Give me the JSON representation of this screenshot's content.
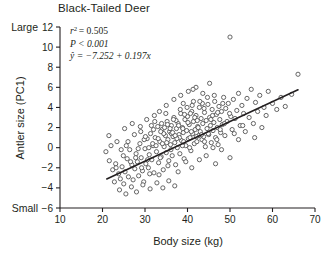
{
  "chart_data": {
    "type": "scatter",
    "title": "Black-Tailed Deer",
    "xlabel": "Body size (kg)",
    "ylabel": "Antler size (PC1)",
    "xlim": [
      10,
      70
    ],
    "ylim": [
      -6,
      12
    ],
    "xticks": [
      10,
      20,
      30,
      40,
      50,
      60,
      70
    ],
    "yticks": [
      -6,
      -4,
      -2,
      0,
      2,
      4,
      6,
      8,
      10,
      12
    ],
    "grid": false,
    "legend": null,
    "axis_end_labels": {
      "y_low": "Small",
      "y_high": "Large"
    },
    "annotations": {
      "r_squared_label": "r",
      "r_squared_sup": "2",
      "r_squared_value": "= 0.505",
      "p_value": "P < 0.001",
      "equation": "ŷ = −7.252 + 0.197x"
    },
    "fit": {
      "type": "linear",
      "intercept": -7.252,
      "slope": 0.197,
      "r_squared": 0.505,
      "p_value": "<0.001",
      "x_start": 21.0,
      "x_end": 66.0
    },
    "marker": {
      "shape": "open-circle",
      "size_px": 4.2,
      "stroke": "#555555",
      "fill": "#ffffff"
    },
    "points": [
      [
        20.8,
        -0.4
      ],
      [
        21.6,
        -1.3
      ],
      [
        22.4,
        -2.2
      ],
      [
        22.0,
        0.2
      ],
      [
        23.1,
        -1.6
      ],
      [
        23.8,
        -2.6
      ],
      [
        24.2,
        -3.1
      ],
      [
        24.6,
        -1.9
      ],
      [
        24.9,
        -0.8
      ],
      [
        25.3,
        -2.4
      ],
      [
        25.0,
        -3.6
      ],
      [
        25.8,
        -1.1
      ],
      [
        26.1,
        -2.9
      ],
      [
        26.4,
        -0.2
      ],
      [
        26.9,
        -1.7
      ],
      [
        27.2,
        -3.2
      ],
      [
        27.6,
        -2.1
      ],
      [
        27.9,
        -0.6
      ],
      [
        28.2,
        -1.4
      ],
      [
        28.5,
        -2.8
      ],
      [
        28.8,
        0.4
      ],
      [
        29.1,
        -1.0
      ],
      [
        29.4,
        -2.3
      ],
      [
        29.7,
        -3.4
      ],
      [
        30.0,
        -0.1
      ],
      [
        30.2,
        -1.6
      ],
      [
        30.5,
        0.9
      ],
      [
        30.8,
        -2.0
      ],
      [
        31.0,
        -0.7
      ],
      [
        31.3,
        1.4
      ],
      [
        31.6,
        -1.2
      ],
      [
        31.9,
        0.2
      ],
      [
        32.1,
        -2.5
      ],
      [
        32.4,
        1.0
      ],
      [
        32.7,
        -0.4
      ],
      [
        33.0,
        2.1
      ],
      [
        33.2,
        -1.5
      ],
      [
        33.5,
        0.6
      ],
      [
        33.8,
        -0.9
      ],
      [
        34.0,
        1.8
      ],
      [
        34.3,
        -2.2
      ],
      [
        34.5,
        0.1
      ],
      [
        34.8,
        1.2
      ],
      [
        35.0,
        -0.5
      ],
      [
        35.2,
        2.6
      ],
      [
        35.4,
        0.8
      ],
      [
        35.6,
        -1.3
      ],
      [
        35.8,
        1.6
      ],
      [
        36.0,
        0.3
      ],
      [
        36.2,
        2.2
      ],
      [
        36.4,
        -0.8
      ],
      [
        36.6,
        1.1
      ],
      [
        36.8,
        3.0
      ],
      [
        37.0,
        0.5
      ],
      [
        37.2,
        -1.7
      ],
      [
        37.4,
        1.9
      ],
      [
        37.6,
        0.0
      ],
      [
        37.8,
        2.4
      ],
      [
        38.0,
        1.3
      ],
      [
        38.2,
        -0.6
      ],
      [
        38.4,
        3.4
      ],
      [
        38.6,
        0.7
      ],
      [
        38.8,
        2.0
      ],
      [
        39.0,
        1.5
      ],
      [
        39.2,
        -1.1
      ],
      [
        39.4,
        2.8
      ],
      [
        39.6,
        0.2
      ],
      [
        39.8,
        1.7
      ],
      [
        40.0,
        3.1
      ],
      [
        40.2,
        0.9
      ],
      [
        40.4,
        2.3
      ],
      [
        40.6,
        1.0
      ],
      [
        40.8,
        -0.3
      ],
      [
        41.0,
        3.6
      ],
      [
        41.2,
        1.4
      ],
      [
        41.4,
        2.6
      ],
      [
        41.6,
        0.4
      ],
      [
        41.8,
        1.8
      ],
      [
        42.0,
        3.2
      ],
      [
        42.2,
        0.6
      ],
      [
        42.4,
        2.1
      ],
      [
        42.6,
        1.2
      ],
      [
        42.8,
        4.0
      ],
      [
        43.0,
        1.6
      ],
      [
        43.2,
        2.9
      ],
      [
        43.4,
        0.8
      ],
      [
        43.6,
        2.4
      ],
      [
        43.8,
        1.1
      ],
      [
        44.0,
        3.5
      ],
      [
        44.2,
        0.1
      ],
      [
        44.4,
        2.7
      ],
      [
        44.6,
        1.9
      ],
      [
        44.8,
        4.3
      ],
      [
        45.0,
        1.3
      ],
      [
        45.2,
        3.0
      ],
      [
        45.4,
        2.2
      ],
      [
        45.6,
        0.5
      ],
      [
        45.8,
        3.8
      ],
      [
        46.0,
        1.7
      ],
      [
        46.2,
        2.5
      ],
      [
        46.4,
        4.6
      ],
      [
        46.6,
        1.0
      ],
      [
        46.8,
        3.3
      ],
      [
        47.0,
        2.0
      ],
      [
        47.2,
        0.3
      ],
      [
        47.4,
        4.1
      ],
      [
        47.6,
        2.8
      ],
      [
        47.8,
        1.5
      ],
      [
        48.0,
        3.6
      ],
      [
        48.2,
        2.3
      ],
      [
        48.5,
        5.0
      ],
      [
        48.8,
        1.2
      ],
      [
        49.0,
        3.9
      ],
      [
        49.3,
        2.6
      ],
      [
        49.6,
        4.4
      ],
      [
        50.0,
        11.0
      ],
      [
        50.2,
        3.1
      ],
      [
        50.5,
        1.8
      ],
      [
        50.8,
        4.8
      ],
      [
        51.2,
        2.9
      ],
      [
        51.6,
        3.7
      ],
      [
        52.0,
        5.4
      ],
      [
        52.4,
        2.2
      ],
      [
        52.8,
        4.2
      ],
      [
        53.2,
        3.4
      ],
      [
        53.6,
        1.6
      ],
      [
        54.0,
        4.9
      ],
      [
        54.5,
        3.0
      ],
      [
        55.0,
        5.8
      ],
      [
        55.5,
        2.4
      ],
      [
        56.0,
        4.5
      ],
      [
        56.5,
        3.6
      ],
      [
        57.0,
        5.2
      ],
      [
        57.5,
        2.0
      ],
      [
        58.0,
        4.0
      ],
      [
        58.5,
        3.2
      ],
      [
        59.0,
        5.6
      ],
      [
        60.0,
        4.4
      ],
      [
        61.0,
        3.8
      ],
      [
        62.0,
        5.0
      ],
      [
        63.0,
        4.1
      ],
      [
        64.5,
        5.3
      ],
      [
        66.0,
        7.3
      ],
      [
        24.0,
        -4.2
      ],
      [
        25.5,
        -4.6
      ],
      [
        26.8,
        -3.9
      ],
      [
        28.0,
        -4.4
      ],
      [
        29.5,
        -3.7
      ],
      [
        31.2,
        -4.1
      ],
      [
        32.8,
        -3.5
      ],
      [
        34.2,
        -4.0
      ],
      [
        35.6,
        -3.3
      ],
      [
        37.0,
        -3.8
      ],
      [
        21.5,
        1.2
      ],
      [
        23.4,
        0.6
      ],
      [
        25.2,
        1.9
      ],
      [
        27.0,
        2.4
      ],
      [
        22.8,
        -3.4
      ],
      [
        33.4,
        3.6
      ],
      [
        35.0,
        4.2
      ],
      [
        36.8,
        4.8
      ],
      [
        38.4,
        5.2
      ],
      [
        40.2,
        5.6
      ],
      [
        42.0,
        6.0
      ],
      [
        43.6,
        5.4
      ],
      [
        45.2,
        6.4
      ],
      [
        39.0,
        4.4
      ],
      [
        41.4,
        4.6
      ],
      [
        30.4,
        2.8
      ],
      [
        32.2,
        3.2
      ],
      [
        34.6,
        2.0
      ],
      [
        36.2,
        1.4
      ],
      [
        38.8,
        0.2
      ],
      [
        29.0,
        1.6
      ],
      [
        31.8,
        0.4
      ],
      [
        33.6,
        -1.0
      ],
      [
        35.4,
        -1.8
      ],
      [
        37.8,
        -2.4
      ],
      [
        39.6,
        -1.4
      ],
      [
        41.0,
        -2.0
      ],
      [
        42.8,
        -1.2
      ],
      [
        44.4,
        -0.8
      ],
      [
        46.6,
        -1.6
      ],
      [
        48.0,
        -0.2
      ],
      [
        50.0,
        -1.0
      ],
      [
        52.0,
        0.8
      ],
      [
        44.0,
        0.6
      ],
      [
        46.0,
        0.0
      ],
      [
        35.1,
        0.5
      ],
      [
        36.5,
        1.5
      ],
      [
        37.3,
        2.7
      ],
      [
        38.1,
        1.0
      ],
      [
        39.3,
        3.3
      ],
      [
        40.1,
        2.5
      ],
      [
        40.9,
        1.6
      ],
      [
        41.7,
        3.0
      ],
      [
        42.5,
        2.0
      ],
      [
        43.3,
        1.3
      ],
      [
        34.4,
        1.4
      ],
      [
        33.1,
        0.9
      ],
      [
        32.0,
        1.8
      ],
      [
        30.9,
        0.0
      ],
      [
        29.8,
        0.8
      ],
      [
        43.9,
        3.9
      ],
      [
        45.5,
        2.8
      ],
      [
        47.1,
        3.5
      ],
      [
        48.7,
        2.4
      ],
      [
        49.9,
        3.4
      ],
      [
        36.1,
        -0.2
      ],
      [
        37.5,
        0.9
      ],
      [
        38.9,
        1.9
      ],
      [
        40.5,
        0.0
      ],
      [
        42.1,
        1.1
      ],
      [
        26.0,
        0.6
      ],
      [
        27.5,
        1.3
      ],
      [
        28.9,
        2.1
      ],
      [
        30.1,
        1.1
      ],
      [
        31.5,
        2.2
      ],
      [
        44.9,
        1.4
      ],
      [
        46.9,
        0.8
      ],
      [
        51.0,
        1.4
      ],
      [
        53.0,
        2.2
      ],
      [
        55.8,
        1.0
      ],
      [
        38.3,
        3.8
      ],
      [
        39.9,
        4.0
      ],
      [
        41.1,
        4.2
      ],
      [
        34.9,
        3.4
      ],
      [
        33.9,
        2.4
      ],
      [
        36.7,
        2.8
      ],
      [
        37.9,
        2.2
      ],
      [
        35.9,
        1.9
      ],
      [
        34.1,
        0.4
      ],
      [
        32.6,
        0.2
      ],
      [
        40.7,
        3.4
      ],
      [
        42.3,
        2.7
      ],
      [
        43.5,
        4.4
      ],
      [
        45.9,
        3.2
      ],
      [
        47.7,
        1.8
      ],
      [
        30.6,
        -1.2
      ],
      [
        31.1,
        -2.6
      ],
      [
        33.3,
        -2.7
      ],
      [
        29.2,
        -2.0
      ],
      [
        27.8,
        -1.0
      ],
      [
        28.4,
        -0.1
      ],
      [
        26.6,
        -1.4
      ],
      [
        25.6,
        0.2
      ],
      [
        24.4,
        -0.2
      ],
      [
        23.2,
        -2.0
      ],
      [
        46.3,
        5.2
      ],
      [
        48.3,
        4.4
      ],
      [
        44.7,
        5.0
      ],
      [
        42.9,
        4.6
      ],
      [
        41.3,
        5.8
      ],
      [
        39.1,
        0.6
      ],
      [
        37.1,
        1.2
      ],
      [
        35.3,
        2.3
      ],
      [
        33.7,
        1.6
      ],
      [
        32.3,
        2.6
      ]
    ]
  }
}
